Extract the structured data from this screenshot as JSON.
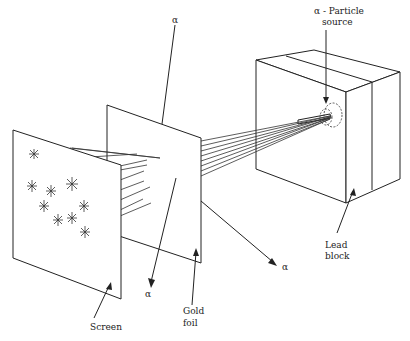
{
  "figure": {
    "labels": {
      "source_line1": "α - Particle",
      "source_line2": "source",
      "lead_line1": "Lead",
      "lead_line2": "block",
      "gold_line1": "Gold",
      "gold_line2": "foil",
      "screen": "Screen",
      "alpha_top": "α",
      "alpha_mid": "α",
      "alpha_down": "α",
      "alpha_right": "α"
    },
    "components": [
      {
        "name": "α-particle source",
        "location": "inside lead block"
      },
      {
        "name": "Lead block",
        "role": "collimator"
      },
      {
        "name": "Gold foil",
        "role": "target"
      },
      {
        "name": "Screen",
        "role": "detector with scintillation flashes"
      }
    ],
    "scintillations": 9,
    "beam_lines": 8,
    "colors": {
      "line": "#222222",
      "background": "#ffffff"
    }
  }
}
